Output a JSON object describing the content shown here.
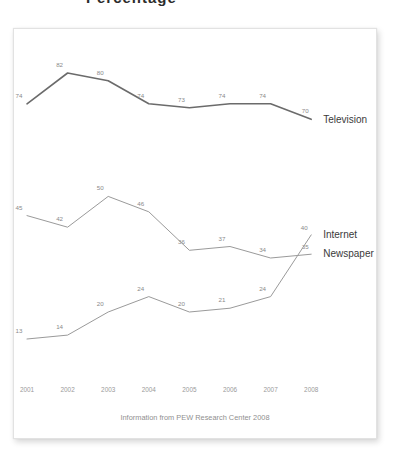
{
  "page": {
    "cropped_title_fragment": "Percentage"
  },
  "caption": "Information from PEW Research Center 2008",
  "colors": {
    "television_line": "#6b6b6b",
    "newspaper_line": "#9a9a9a",
    "internet_line": "#9a9a9a",
    "value_label": "#8a8a8a",
    "tick_label": "#9a9a9a",
    "series_label": "#3a3a3a",
    "caption": "#8f8f8f",
    "card_background": "#ffffff",
    "card_border": "#e2e2e2"
  },
  "series_labels": {
    "television": "Television",
    "internet": "Internet",
    "newspaper": "Newspaper"
  },
  "chart_data": {
    "type": "line",
    "title": "Percentage",
    "subtitle": "",
    "xlabel": "",
    "ylabel": "",
    "caption": "Information from PEW Research Center 2008",
    "grid": false,
    "legend_position": "right-inline-labels",
    "x": [
      2001,
      2002,
      2003,
      2004,
      2005,
      2006,
      2007,
      2008
    ],
    "categories": [
      "2001",
      "2002",
      "2003",
      "2004",
      "2005",
      "2006",
      "2007",
      "2008"
    ],
    "xlim": [
      2001,
      2008
    ],
    "ylim": [
      10,
      85
    ],
    "series": [
      {
        "name": "Television",
        "values": [
          74,
          82,
          80,
          74,
          73,
          74,
          74,
          70
        ],
        "color": "#6b6b6b",
        "width": 1.6,
        "labels": [
          "74",
          "82",
          "80",
          "74",
          "73",
          "74",
          "74",
          "70"
        ]
      },
      {
        "name": "Newspaper",
        "values": [
          45,
          42,
          50,
          46,
          36,
          37,
          34,
          35
        ],
        "color": "#9a9a9a",
        "width": 1.0,
        "labels": [
          "45",
          "42",
          "50",
          "46",
          "36",
          "37",
          "34",
          "35"
        ]
      },
      {
        "name": "Internet",
        "values": [
          13,
          14,
          20,
          24,
          20,
          21,
          24,
          40
        ],
        "color": "#9a9a9a",
        "width": 1.0,
        "labels": [
          "13",
          "14",
          "20",
          "24",
          "20",
          "21",
          "24",
          "40"
        ]
      }
    ]
  }
}
